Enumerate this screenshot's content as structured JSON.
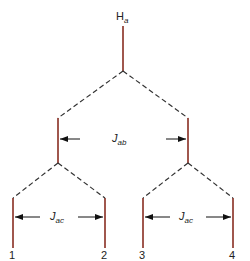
{
  "diagram": {
    "type": "splitting-tree",
    "top_label": {
      "main": "H",
      "sub": "a"
    },
    "couplings": [
      {
        "main": "J",
        "sub": "ab"
      },
      {
        "main": "J",
        "sub": "ac"
      },
      {
        "main": "J",
        "sub": "ac"
      }
    ],
    "lines": [
      "1",
      "2",
      "3",
      "4"
    ],
    "colors": {
      "line": "#a0574e",
      "dash": "#333333",
      "arrow": "#111111"
    }
  }
}
